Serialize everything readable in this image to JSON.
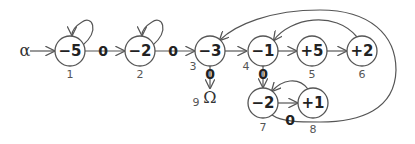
{
  "diagram": {
    "start_symbol": "α",
    "end_symbol": "Ω",
    "nodes": [
      {
        "id": 1,
        "value": "−5",
        "index": "1"
      },
      {
        "id": 2,
        "value": "−2",
        "index": "2"
      },
      {
        "id": 3,
        "value": "−3",
        "index": "3"
      },
      {
        "id": 4,
        "value": "−1",
        "index": "4"
      },
      {
        "id": 5,
        "value": "+5",
        "index": "5"
      },
      {
        "id": 6,
        "value": "+2",
        "index": "6"
      },
      {
        "id": 7,
        "value": "−2",
        "index": "7"
      },
      {
        "id": 8,
        "value": "+1",
        "index": "8"
      },
      {
        "id": 9,
        "value": "Ω",
        "index": "9"
      }
    ],
    "edges": [
      {
        "from": "α",
        "to": 1,
        "label": ""
      },
      {
        "from": 1,
        "to": 1,
        "label": ""
      },
      {
        "from": 1,
        "to": 2,
        "label": "0"
      },
      {
        "from": 2,
        "to": 2,
        "label": ""
      },
      {
        "from": 2,
        "to": 3,
        "label": "0"
      },
      {
        "from": 3,
        "to": 4,
        "label": ""
      },
      {
        "from": 3,
        "to": 9,
        "label": "0"
      },
      {
        "from": 4,
        "to": 5,
        "label": ""
      },
      {
        "from": 5,
        "to": 6,
        "label": ""
      },
      {
        "from": 6,
        "to": 4,
        "label": ""
      },
      {
        "from": 4,
        "to": 7,
        "label": "0"
      },
      {
        "from": 7,
        "to": 8,
        "label": ""
      },
      {
        "from": 8,
        "to": 7,
        "label": ""
      },
      {
        "from": 7,
        "to": 3,
        "label": "0"
      }
    ]
  }
}
